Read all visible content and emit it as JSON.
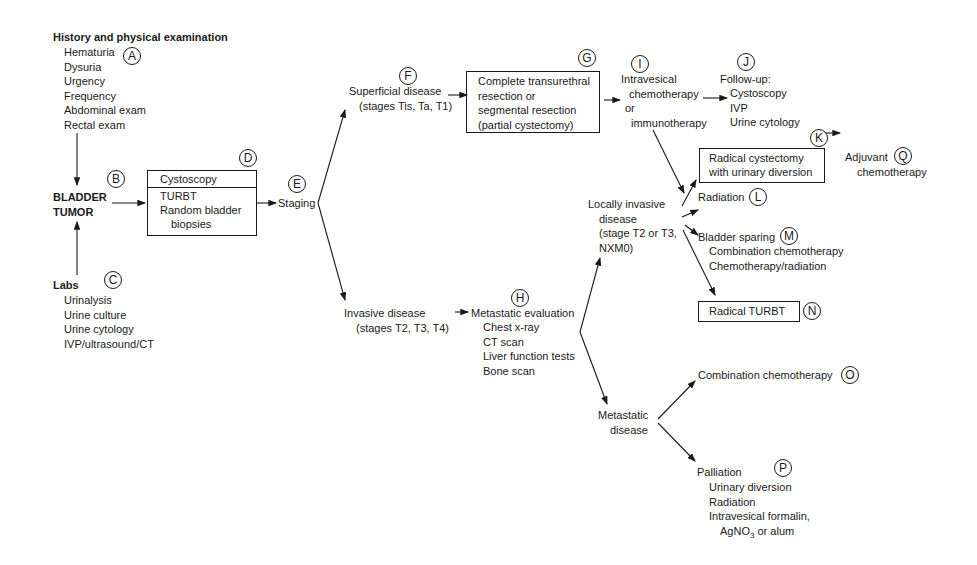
{
  "diagram": {
    "type": "flowchart",
    "nodes": {
      "A": {
        "label": "A",
        "title": "History and physical examination",
        "items": [
          "Hematuria",
          "Dysuria",
          "Urgency",
          "Frequency",
          "Abdominal exam",
          "Rectal exam"
        ]
      },
      "B": {
        "label": "B",
        "title_lines": [
          "BLADDER",
          "TUMOR"
        ]
      },
      "C": {
        "label": "C",
        "title": "Labs",
        "items": [
          "Urinalysis",
          "Urine culture",
          "Urine cytology",
          "IVP/ultrasound/CT"
        ]
      },
      "D": {
        "label": "D",
        "header": "Cystoscopy",
        "items": [
          "TURBT",
          "Random bladder",
          "biopsies"
        ]
      },
      "E": {
        "label": "E",
        "title": "Staging"
      },
      "F": {
        "label": "F",
        "lines": [
          "Superficial disease",
          "(stages Tis, Ta, T1)"
        ]
      },
      "G": {
        "label": "G",
        "lines": [
          "Complete transurethral",
          "resection or",
          "segmental resection",
          "(partial cystectomy)"
        ]
      },
      "I": {
        "label": "I",
        "lines": [
          "Intravesical",
          "chemotherapy",
          "or",
          "immunotherapy"
        ]
      },
      "J": {
        "label": "J",
        "title": "Follow-up:",
        "items": [
          "Cystoscopy",
          "IVP",
          "Urine cytology"
        ]
      },
      "K": {
        "label": "K",
        "lines": [
          "Radical cystectomy",
          "with urinary diversion"
        ]
      },
      "Q": {
        "label": "Q",
        "lines": [
          "Adjuvant",
          "chemotherapy"
        ]
      },
      "invasive": {
        "lines": [
          "Invasive disease",
          "(stages T2, T3, T4)"
        ]
      },
      "H": {
        "label": "H",
        "title": "Metastatic evaluation",
        "items": [
          "Chest x-ray",
          "CT scan",
          "Liver function tests",
          "Bone scan"
        ]
      },
      "locally": {
        "lines": [
          "Locally invasive",
          "disease",
          "(stage T2 or T3,",
          "NXM0)"
        ]
      },
      "L": {
        "label": "L",
        "title": "Radiation"
      },
      "M": {
        "label": "M",
        "title": "Bladder sparing",
        "items": [
          "Combination chemotherapy",
          "Chemotherapy/radiation"
        ]
      },
      "N": {
        "label": "N",
        "title": "Radical TURBT"
      },
      "metastatic": {
        "lines": [
          "Metastatic",
          "disease"
        ]
      },
      "O": {
        "label": "O",
        "title": "Combination chemotherapy"
      },
      "P": {
        "label": "P",
        "title": "Palliation",
        "items": [
          "Urinary diversion",
          "Radiation",
          "Intravesical formalin,"
        ],
        "last_item_prefix": "AgNO",
        "last_item_sub": "3",
        "last_item_suffix": " or alum"
      }
    }
  }
}
